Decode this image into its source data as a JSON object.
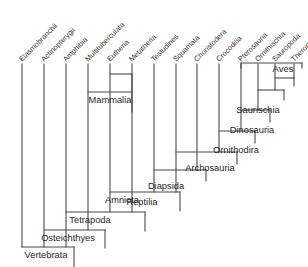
{
  "figure": {
    "type": "cladogram",
    "title": "",
    "background_color": "#ffffff",
    "line_color": "#4a4a4a",
    "text_color": "#2b2b2b"
  },
  "tips": [
    {
      "label": "Elasmobranchii",
      "x": 22
    },
    {
      "label": "Actinopterygii",
      "x": 44
    },
    {
      "label": "Amphibia",
      "x": 66
    },
    {
      "label": "Multituberculata",
      "x": 88
    },
    {
      "label": "Eutheria",
      "x": 110
    },
    {
      "label": "Metatheria",
      "x": 132
    },
    {
      "label": "Testudines",
      "x": 154
    },
    {
      "label": "Squamata",
      "x": 176
    },
    {
      "label": "Choristodera",
      "x": 197
    },
    {
      "label": "Crocodilia",
      "x": 219
    },
    {
      "label": "Pterosauria",
      "x": 241
    },
    {
      "label": "Ornithischia",
      "x": 258
    },
    {
      "label": "Sauropoda",
      "x": 275
    },
    {
      "label": "Theropod clades",
      "x": 294
    }
  ],
  "clades": [
    {
      "name": "Mammalia",
      "label": "Mammalia",
      "x1": 88,
      "x2": 132,
      "bar_y": 92,
      "label_x": 110,
      "label_y": 103,
      "stem_to": 112
    },
    {
      "name": "Eutheria-Metatheria",
      "label": "",
      "x1": 110,
      "x2": 132,
      "bar_y": 74,
      "label_x": 121,
      "label_y": 74,
      "stem_to": 92
    },
    {
      "name": "Saurischia",
      "label": "Saurischia",
      "x1": 275,
      "x2": 294,
      "bar_y": 78,
      "label_x": 258,
      "label_y": 113,
      "stem_to": 86
    },
    {
      "name": "Dinosauria",
      "label": "Dinosauria",
      "x1": 258,
      "x2": 284,
      "bar_y": 90,
      "label_x": 252,
      "label_y": 133,
      "stem_to": 100
    },
    {
      "name": "Ornithodira",
      "label": "Ornithodira",
      "x1": 241,
      "x2": 270,
      "bar_y": 110,
      "label_x": 236,
      "label_y": 153,
      "stem_to": 122
    },
    {
      "name": "Archosauria",
      "label": "Archosauria",
      "x1": 219,
      "x2": 255,
      "bar_y": 131,
      "label_x": 210,
      "label_y": 171,
      "stem_to": 143
    },
    {
      "name": "Diapsida",
      "label": "Diapsida",
      "x1": 176,
      "x2": 237,
      "bar_y": 152,
      "label_x": 166,
      "label_y": 189,
      "stem_to": 164
    },
    {
      "name": "Reptilia",
      "label": "Reptilia",
      "x1": 154,
      "x2": 206,
      "bar_y": 170,
      "label_x": 142,
      "label_y": 205,
      "stem_to": 181
    },
    {
      "name": "Amniota",
      "label": "Amniota",
      "x1": 110,
      "x2": 180,
      "bar_y": 192,
      "label_x": 122,
      "label_y": 203,
      "stem_to": 211
    },
    {
      "name": "Tetrapoda",
      "label": "Tetrapoda",
      "x1": 66,
      "x2": 145,
      "bar_y": 212,
      "label_x": 90,
      "label_y": 223,
      "stem_to": 231
    },
    {
      "name": "Osteichthyes",
      "label": "Osteichthyes",
      "x1": 44,
      "x2": 105,
      "bar_y": 230,
      "label_x": 68,
      "label_y": 241,
      "stem_to": 248
    },
    {
      "name": "Vertebrata",
      "label": "Vertebrata",
      "x1": 22,
      "x2": 74,
      "bar_y": 247,
      "label_x": 46,
      "label_y": 258,
      "stem_to": 267
    }
  ],
  "aves_bracket": {
    "label": "Aves",
    "x1": 241,
    "x2": 302,
    "y": 63,
    "tick_height": 5,
    "label_x": 283,
    "label_y": 72
  },
  "axis": {
    "tip_top_y": 64,
    "label_angle_deg": -45
  }
}
